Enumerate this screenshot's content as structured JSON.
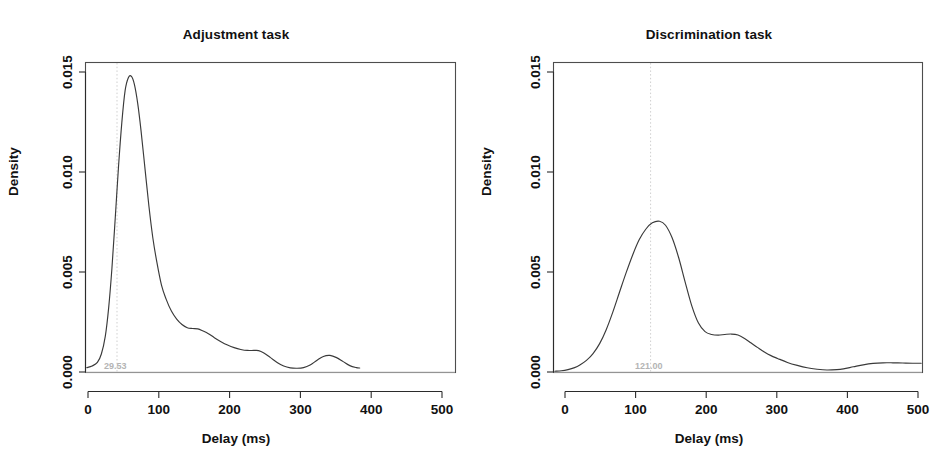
{
  "figure": {
    "background": "#ffffff",
    "curve_color": "#3a3a3a",
    "marker_color": "#cfcfcf",
    "axis_color": "#2b2b2b",
    "width": 945,
    "height": 464
  },
  "chart_data": [
    {
      "type": "line",
      "title": "Adjustment task",
      "xlabel": "Delay (ms)",
      "ylabel": "Density",
      "xlim": [
        -40,
        520
      ],
      "ylim": [
        0,
        0.0155
      ],
      "xticks": [
        0,
        100,
        200,
        300,
        400,
        500
      ],
      "xtick_labels": [
        "0",
        "100",
        "200",
        "300",
        "400",
        "500"
      ],
      "yticks": [
        0.0,
        0.005,
        0.01,
        0.015
      ],
      "ytick_labels": [
        "0.000",
        "0.005",
        "0.010",
        "0.015"
      ],
      "grid": false,
      "legend": "none",
      "annotation": {
        "label": "29.53",
        "x": 29.53,
        "kind": "vertical-dotted-line-at-mode"
      },
      "peak": {
        "x": 29.53,
        "y": 0.0148
      },
      "x": [
        -38,
        -30,
        -22,
        -16,
        -10,
        -5,
        0,
        5,
        10,
        15,
        20,
        25,
        29.53,
        34,
        39,
        44,
        50,
        56,
        62,
        68,
        75,
        82,
        90,
        98,
        106,
        114,
        122,
        130,
        138,
        146,
        155,
        165,
        175,
        185,
        195,
        205,
        215,
        222,
        230,
        240,
        250,
        260,
        270,
        280,
        290,
        300,
        310,
        320,
        330,
        340,
        350,
        360,
        370,
        375
      ],
      "y": [
        0.00022,
        0.0003,
        0.00048,
        0.0009,
        0.0018,
        0.0032,
        0.0052,
        0.0077,
        0.0103,
        0.0125,
        0.0141,
        0.01475,
        0.0148,
        0.0144,
        0.01345,
        0.0121,
        0.0102,
        0.0083,
        0.0067,
        0.0055,
        0.00435,
        0.00365,
        0.00305,
        0.00265,
        0.00238,
        0.00222,
        0.00218,
        0.00216,
        0.00205,
        0.00192,
        0.00172,
        0.00152,
        0.00135,
        0.00122,
        0.00113,
        0.00108,
        0.00108,
        0.00107,
        0.00095,
        0.00072,
        0.00048,
        0.0003,
        0.00021,
        0.00019,
        0.00022,
        0.00035,
        0.00058,
        0.00078,
        0.00083,
        0.00072,
        0.00052,
        0.00032,
        0.00022,
        0.0002
      ]
    },
    {
      "type": "line",
      "title": "Discrimination task",
      "xlabel": "Delay (ms)",
      "ylabel": "Density",
      "xlim": [
        -40,
        520
      ],
      "ylim": [
        0,
        0.0155
      ],
      "xticks": [
        0,
        100,
        200,
        300,
        400,
        500
      ],
      "xtick_labels": [
        "0",
        "100",
        "200",
        "300",
        "400",
        "500"
      ],
      "yticks": [
        0.0,
        0.005,
        0.01,
        0.015
      ],
      "ytick_labels": [
        "0.000",
        "0.005",
        "0.010",
        "0.015"
      ],
      "grid": false,
      "legend": "none",
      "annotation": {
        "label": "121.00",
        "x": 121.0,
        "kind": "vertical-dotted-line-at-mode"
      },
      "peak": {
        "x": 121.0,
        "y": 0.00755
      },
      "x": [
        -38,
        -28,
        -18,
        -8,
        0,
        10,
        20,
        30,
        40,
        50,
        60,
        70,
        80,
        90,
        100,
        110,
        121,
        130,
        140,
        150,
        160,
        170,
        180,
        190,
        200,
        210,
        220,
        230,
        240,
        250,
        260,
        270,
        280,
        290,
        300,
        315,
        330,
        345,
        360,
        375,
        390,
        400,
        415,
        430,
        445,
        460,
        475,
        490,
        505,
        518
      ],
      "y": [
        4e-05,
        6e-05,
        0.00012,
        0.00022,
        0.00035,
        0.00058,
        0.00092,
        0.00142,
        0.00212,
        0.003,
        0.00398,
        0.00495,
        0.00585,
        0.00662,
        0.00715,
        0.00747,
        0.00755,
        0.00735,
        0.00672,
        0.00572,
        0.00448,
        0.0033,
        0.00245,
        0.00202,
        0.00188,
        0.00185,
        0.00188,
        0.0019,
        0.00185,
        0.00168,
        0.00145,
        0.00122,
        0.001,
        0.00082,
        0.00068,
        0.00048,
        0.00033,
        0.00021,
        0.00014,
        0.0001,
        0.00012,
        0.00016,
        0.00026,
        0.00036,
        0.00043,
        0.00046,
        0.00046,
        0.00045,
        0.00044,
        0.00044
      ]
    }
  ]
}
